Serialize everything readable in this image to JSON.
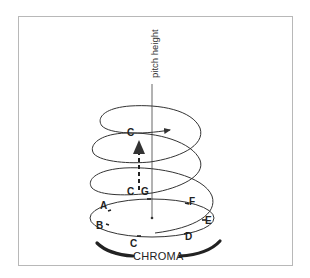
{
  "figure": {
    "axis_label": "pitch height",
    "chroma_label": "CHROMA",
    "notes": {
      "c_top": "C",
      "c_mid": "C",
      "g": "G",
      "a": "A",
      "b": "B",
      "c_bottom": "C",
      "d": "D",
      "e": "E",
      "f": "F"
    },
    "colors": {
      "line": "#333333",
      "frame": "#b8b8b8",
      "background": "#ffffff"
    }
  }
}
